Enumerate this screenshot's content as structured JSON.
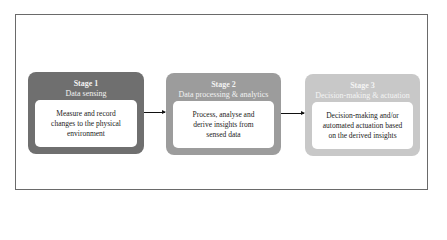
{
  "diagram": {
    "type": "flowchart",
    "direction": "left-to-right",
    "stages": [
      {
        "number": "Stage 1",
        "name": "Data sensing",
        "description": "Measure and record changes to the physical environment",
        "color": "#6f6f6f"
      },
      {
        "number": "Stage 2",
        "name": "Data processing & analytics",
        "description": "Process, analyse and derive insights from sensed data",
        "color": "#9c9c9c"
      },
      {
        "number": "Stage 3",
        "name": "Decision-making & actuation",
        "description": "Decision-making and/or automated actuation based on the derived insights",
        "color": "#c8c8c8"
      }
    ],
    "edges": [
      {
        "from": "Stage 1",
        "to": "Stage 2"
      },
      {
        "from": "Stage 2",
        "to": "Stage 3"
      }
    ]
  }
}
